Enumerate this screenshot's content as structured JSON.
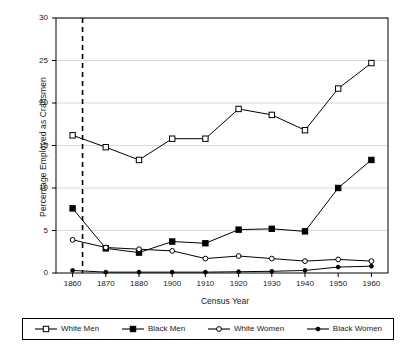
{
  "chart_data": {
    "type": "line",
    "title": "",
    "xlabel": "Census Year",
    "ylabel": "Percentage Employed as Craftsmen",
    "x": [
      1860,
      1870,
      1880,
      1900,
      1910,
      1920,
      1930,
      1940,
      1950,
      1960
    ],
    "xticklabels": [
      "1860",
      "1870",
      "1880",
      "1900",
      "1910",
      "1920",
      "1930",
      "1940",
      "1950",
      "1960"
    ],
    "yticklabels": [
      "0",
      "5",
      "10",
      "15",
      "20",
      "25",
      "30"
    ],
    "yticks": [
      0,
      5,
      10,
      15,
      20,
      25,
      30
    ],
    "ylim": [
      0,
      30
    ],
    "grid": "horizontal",
    "legend_position": "bottom",
    "annotations": [
      {
        "type": "vline",
        "style": "dashed",
        "x": 1863,
        "label": ""
      }
    ],
    "series": [
      {
        "name": "White Men",
        "marker": "open-square",
        "values": [
          16.2,
          14.8,
          13.3,
          15.8,
          15.8,
          19.3,
          18.6,
          16.8,
          21.7,
          24.7
        ]
      },
      {
        "name": "Black Men",
        "marker": "filled-square",
        "values": [
          7.6,
          2.9,
          2.4,
          3.7,
          3.5,
          5.1,
          5.2,
          4.9,
          10.0,
          13.3
        ]
      },
      {
        "name": "White Women",
        "marker": "open-circle",
        "values": [
          3.9,
          3.0,
          2.8,
          2.6,
          1.7,
          2.0,
          1.7,
          1.4,
          1.6,
          1.4
        ]
      },
      {
        "name": "Black Women",
        "marker": "filled-circle",
        "values": [
          0.3,
          0.1,
          0.1,
          0.1,
          0.1,
          0.15,
          0.2,
          0.3,
          0.7,
          0.8
        ]
      }
    ]
  },
  "legend": {
    "items": [
      {
        "label": "White Men",
        "marker": "open-square"
      },
      {
        "label": "Black Men",
        "marker": "filled-square"
      },
      {
        "label": "White Women",
        "marker": "open-circle"
      },
      {
        "label": "Black Women",
        "marker": "filled-circle"
      }
    ]
  },
  "colors": {
    "line": "#000000",
    "grid": "#d9d9d9",
    "axis": "#000000",
    "background": "#ffffff",
    "marker_fill_open": "#ffffff",
    "marker_fill_closed": "#000000"
  }
}
